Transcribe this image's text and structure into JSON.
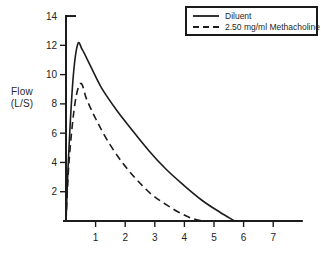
{
  "chart_data": {
    "type": "line",
    "title": "",
    "xlabel": "",
    "ylabel": "Flow (L/S)",
    "ylabel_lines": [
      "Flow",
      "(L/S)"
    ],
    "xlim": [
      0,
      8
    ],
    "ylim": [
      0,
      14
    ],
    "x_ticks": [
      1,
      2,
      3,
      4,
      5,
      6,
      7
    ],
    "y_ticks": [
      2,
      4,
      6,
      8,
      10,
      12,
      14
    ],
    "grid": false,
    "legend_position": "top-right",
    "ink_color": "#1c1c1c",
    "series": [
      {
        "name": "Diluent",
        "style": "solid",
        "color": "#1c1c1c",
        "peak_flow": 12.1,
        "x": [
          0,
          0.1,
          0.25,
          0.4,
          0.55,
          0.8,
          1.2,
          1.7,
          2.2,
          2.8,
          3.4,
          4.0,
          4.6,
          5.2,
          5.7
        ],
        "y": [
          0,
          5.0,
          10.0,
          12.1,
          11.7,
          10.7,
          9.1,
          7.6,
          6.3,
          4.8,
          3.5,
          2.4,
          1.4,
          0.6,
          0
        ]
      },
      {
        "name": "2.50 mg/ml Methacholine",
        "style": "dashed",
        "color": "#1c1c1c",
        "peak_flow": 9.4,
        "x": [
          0,
          0.1,
          0.3,
          0.5,
          0.7,
          1.0,
          1.4,
          1.9,
          2.4,
          2.9,
          3.4,
          3.9,
          4.3,
          4.6
        ],
        "y": [
          0,
          4.0,
          8.0,
          9.4,
          8.3,
          7.0,
          5.5,
          4.0,
          2.8,
          1.8,
          1.1,
          0.5,
          0.15,
          0
        ]
      }
    ]
  }
}
